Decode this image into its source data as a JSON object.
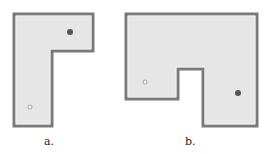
{
  "figures": [
    {
      "id": "a",
      "label": "a.",
      "shape": "L-shaped room",
      "hollow_dot": "light marker at lower-left",
      "filled_dot": "dark marker at upper-right"
    },
    {
      "id": "b",
      "label": "b.",
      "shape": "U-shaped room with notch at bottom",
      "hollow_dot": "light marker at left",
      "filled_dot": "dark marker at lower-right"
    }
  ],
  "colors": {
    "fill": "#e6e6e6",
    "wall": "#7a7a7a",
    "dot_dark": "#555555",
    "dot_light": "#ffffff"
  }
}
